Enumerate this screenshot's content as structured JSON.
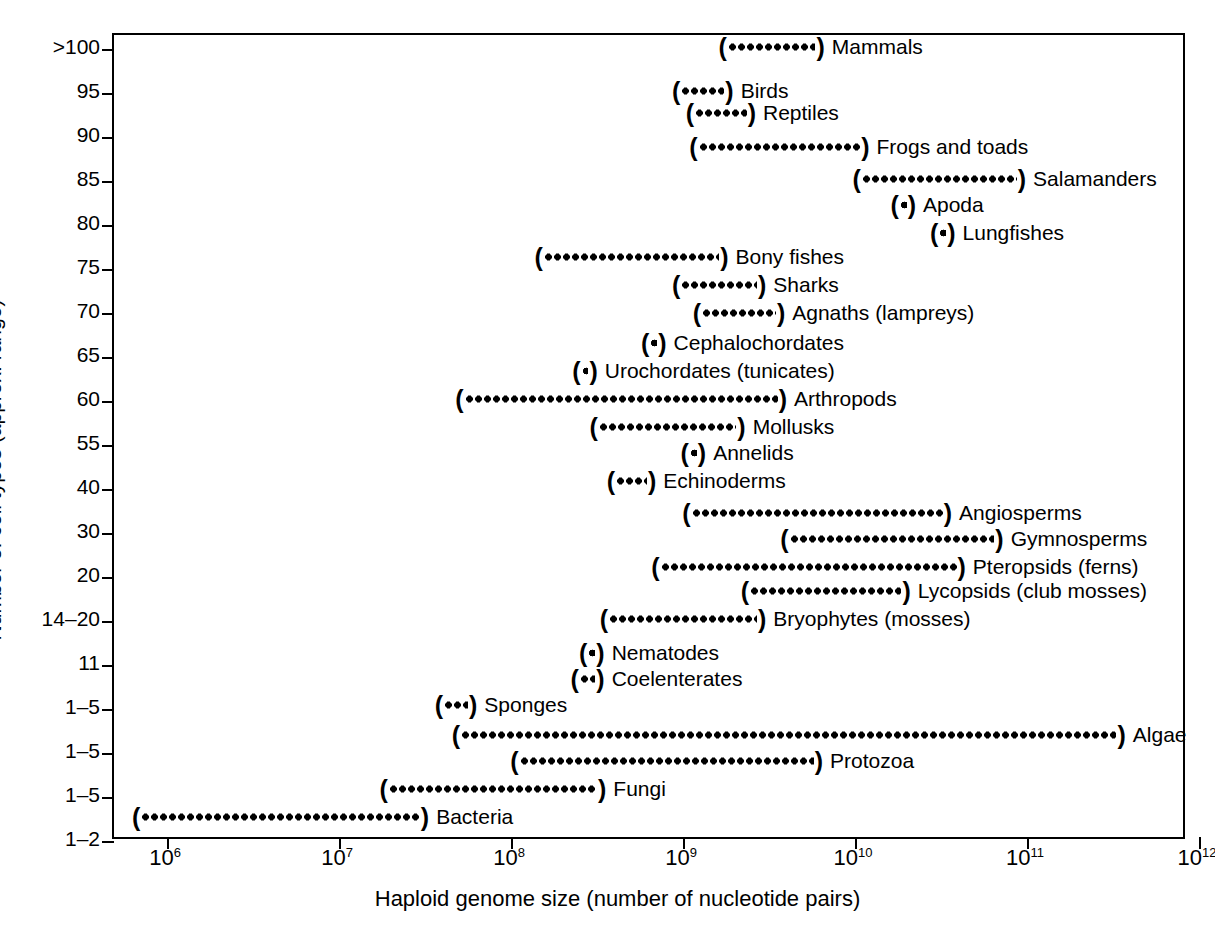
{
  "chart_data": {
    "type": "scatter",
    "title": "",
    "xlabel": "Haploid genome size (number of nucleotide pairs)",
    "ylabel": "Number of cell types (approx. range)",
    "xlim": [
      5.71,
      12.07
    ],
    "xscale": "log10",
    "xticks": [
      6,
      7,
      8,
      9,
      10,
      11,
      12
    ],
    "xticklabels": [
      "10⁶",
      "10⁷",
      "10⁸",
      "10⁹",
      "10¹⁰",
      "10¹¹",
      "10¹²"
    ],
    "grid": false,
    "legend": null,
    "yticklabels": [
      ">100",
      "95",
      "90",
      "85",
      "80",
      "75",
      "70",
      "65",
      "60",
      "55",
      "40",
      "30",
      "20",
      "14–20",
      "11",
      "1–5",
      "1–5",
      "1–5",
      "1–2"
    ],
    "note": "Each taxon is drawn as a parenthesized dotted bar spanning its approximate haploid genome-size range; y position is the approximate number of cell types.",
    "rows": [
      {
        "label": "Mammals",
        "cell_types": ">100",
        "x_start_log": 9.27,
        "x_end_log": 9.78
      },
      {
        "label": "Birds",
        "cell_types": "95",
        "x_start_log": 9.0,
        "x_end_log": 9.25
      },
      {
        "label": "Reptiles",
        "cell_types": "93",
        "x_start_log": 9.08,
        "x_end_log": 9.38
      },
      {
        "label": "Frogs and toads",
        "cell_types": "90",
        "x_start_log": 9.1,
        "x_end_log": 10.04
      },
      {
        "label": "Salamanders",
        "cell_types": "87",
        "x_start_log": 10.05,
        "x_end_log": 10.95
      },
      {
        "label": "Apoda",
        "cell_types": "82",
        "x_start_log": 10.27,
        "x_end_log": 10.31
      },
      {
        "label": "Lungfishes",
        "cell_types": "80",
        "x_start_log": 10.5,
        "x_end_log": 10.54
      },
      {
        "label": "Bony fishes",
        "cell_types": "77",
        "x_start_log": 8.2,
        "x_end_log": 9.22
      },
      {
        "label": "Sharks",
        "cell_types": "75",
        "x_start_log": 9.0,
        "x_end_log": 9.44
      },
      {
        "label": "Agnaths (lampreys)",
        "cell_types": "72",
        "x_start_log": 9.12,
        "x_end_log": 9.55
      },
      {
        "label": "Cephalochordates",
        "cell_types": "67",
        "x_start_log": 8.82,
        "x_end_log": 8.86
      },
      {
        "label": "Urochordates (tunicates)",
        "cell_types": "65",
        "x_start_log": 8.42,
        "x_end_log": 8.46
      },
      {
        "label": "Arthropods",
        "cell_types": "62",
        "x_start_log": 7.74,
        "x_end_log": 9.56
      },
      {
        "label": "Mollusks",
        "cell_types": "60",
        "x_start_log": 8.52,
        "x_end_log": 9.32
      },
      {
        "label": "Annelids",
        "cell_types": "57",
        "x_start_log": 9.05,
        "x_end_log": 9.09
      },
      {
        "label": "Echinoderms",
        "cell_types": "55",
        "x_start_log": 8.62,
        "x_end_log": 8.8
      },
      {
        "label": "Angiosperms",
        "cell_types": "40",
        "x_start_log": 9.06,
        "x_end_log": 10.52
      },
      {
        "language": "",
        "label": "Gymnosperms",
        "cell_types": "35",
        "x_start_log": 9.63,
        "x_end_log": 10.82
      },
      {
        "label": "Pteropsids (ferns)",
        "cell_types": "30",
        "x_start_log": 8.88,
        "x_end_log": 10.6
      },
      {
        "label": "Lycopsids (club mosses)",
        "cell_types": "25",
        "x_start_log": 9.4,
        "x_end_log": 10.28
      },
      {
        "label": "Bryophytes (mosses)",
        "cell_types": "20",
        "x_start_log": 8.58,
        "x_end_log": 9.44
      },
      {
        "label": "Nematodes",
        "cell_types": "14–20",
        "x_start_log": 8.46,
        "x_end_log": 8.5
      },
      {
        "label": "Coelenterates",
        "cell_types": "14–20",
        "x_start_log": 8.41,
        "x_end_log": 8.5
      },
      {
        "label": "Sponges",
        "cell_types": "11",
        "x_start_log": 7.62,
        "x_end_log": 7.76
      },
      {
        "label": "Algae",
        "cell_types": "1–5",
        "x_start_log": 7.72,
        "x_end_log": 11.53
      },
      {
        "label": "Protozoa",
        "cell_types": "1–5",
        "x_start_log": 8.06,
        "x_end_log": 9.77
      },
      {
        "label": "Fungi",
        "cell_types": "1–5",
        "x_start_log": 7.3,
        "x_end_log": 8.51
      },
      {
        "label": "Bacteria",
        "cell_types": "1–2",
        "x_start_log": 5.86,
        "x_end_log": 7.48
      }
    ]
  },
  "caption": ""
}
